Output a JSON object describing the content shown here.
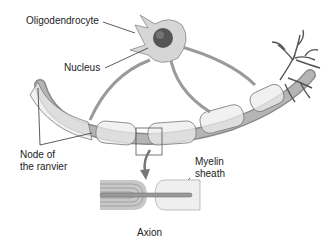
{
  "diagram": {
    "labels": {
      "oligodendrocyte": "Oligodendrocyte",
      "nucleus": "Nucleus",
      "node_line1": "Node of",
      "node_line2": "the ranvier",
      "myelin_line1": "Myelin",
      "myelin_line2": "sheath",
      "axon": "Axion"
    },
    "colors": {
      "cell_fill": "#d6d6d6",
      "nucleus": "#555555",
      "axon": "#a8a8a8",
      "sheath": "#e6e6e6",
      "outline": "#7a7a7a",
      "text": "#222222"
    }
  }
}
